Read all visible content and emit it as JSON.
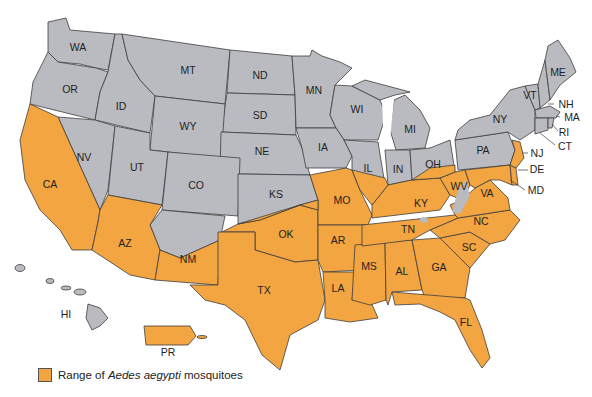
{
  "colors": {
    "in_range": "#F2A540",
    "out_of_range": "#B9BBC0",
    "border": "#3d3d3d",
    "water": "#ffffff"
  },
  "legend": {
    "prefix": "Range of ",
    "species": "Aedes aegypti",
    "suffix": " mosquitoes"
  },
  "states": {
    "WA": "WA",
    "OR": "OR",
    "ID": "ID",
    "MT": "MT",
    "ND": "ND",
    "SD": "SD",
    "WY": "WY",
    "NE": "NE",
    "MN": "MN",
    "WI": "WI",
    "MI": "MI",
    "IA": "IA",
    "IL": "IL",
    "IN": "IN",
    "OH": "OH",
    "PA": "PA",
    "NY": "NY",
    "VT": "VT",
    "ME": "ME",
    "NH": "NH",
    "MA": "MA",
    "RI": "RI",
    "CT": "CT",
    "NJ": "NJ",
    "DE": "DE",
    "MD": "MD",
    "NV": "NV",
    "UT": "UT",
    "CO": "CO",
    "KS": "KS",
    "CA": "CA",
    "AZ": "AZ",
    "NM": "NM",
    "OK": "OK",
    "TX": "TX",
    "MO": "MO",
    "AR": "AR",
    "LA": "LA",
    "MS": "MS",
    "AL": "AL",
    "GA": "GA",
    "FL": "FL",
    "SC": "SC",
    "NC": "NC",
    "TN": "TN",
    "KY": "KY",
    "WV": "WV",
    "VA": "VA",
    "HI": "HI",
    "PR": "PR"
  }
}
